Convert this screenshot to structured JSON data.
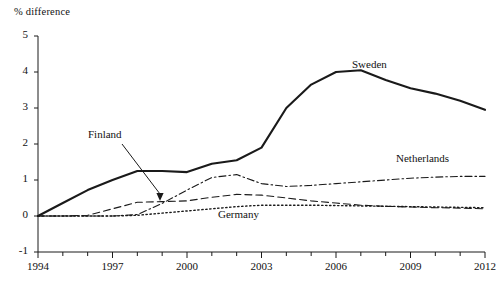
{
  "chart_data": {
    "type": "line",
    "title": "",
    "ylabel": "% difference",
    "xlabel": "",
    "xlim": [
      1994,
      2012
    ],
    "ylim": [
      -1,
      5
    ],
    "grid": false,
    "legend_position": "inline-annotations",
    "x": [
      1994,
      1995,
      1996,
      1997,
      1998,
      1999,
      2000,
      2001,
      2002,
      2003,
      2004,
      2005,
      2006,
      2007,
      2008,
      2009,
      2010,
      2011,
      2012
    ],
    "yticks": [
      "5",
      "4",
      "3",
      "2",
      "1",
      "0",
      "-1"
    ],
    "xticks": [
      "1994",
      "1997",
      "2000",
      "2003",
      "2006",
      "2009",
      "2012"
    ],
    "xticks_minor": [
      "1995",
      "1996",
      "1998",
      "1999",
      "2001",
      "2002",
      "2004",
      "2005",
      "2007",
      "2008",
      "2010",
      "2011"
    ],
    "series": [
      {
        "name": "Sweden",
        "style": "solid",
        "color": "#1a1a1a",
        "width": 2.1,
        "label_x": 352,
        "label_y": 58,
        "values": [
          0.0,
          0.36,
          0.72,
          1.0,
          1.25,
          1.25,
          1.22,
          1.45,
          1.55,
          1.9,
          3.0,
          3.65,
          4.0,
          4.05,
          3.78,
          3.55,
          3.4,
          3.2,
          2.95
        ]
      },
      {
        "name": "Netherlands",
        "style": "dashdot",
        "color": "#1a1a1a",
        "width": 1.1,
        "label_x": 396,
        "label_y": 152,
        "values": [
          0.0,
          0.0,
          0.0,
          0.0,
          0.04,
          0.35,
          0.72,
          1.07,
          1.15,
          0.9,
          0.82,
          0.85,
          0.9,
          0.95,
          1.0,
          1.05,
          1.08,
          1.1,
          1.1
        ]
      },
      {
        "name": "Finland",
        "style": "dashed",
        "color": "#1a1a1a",
        "width": 1.1,
        "label_x": 88,
        "label_y": 128,
        "arrow_from_x": 122,
        "arrow_from_y": 144,
        "arrow_to_x": 160,
        "arrow_to_y": 201,
        "values": [
          0.0,
          0.0,
          0.02,
          0.2,
          0.38,
          0.4,
          0.42,
          0.52,
          0.6,
          0.58,
          0.5,
          0.42,
          0.36,
          0.3,
          0.27,
          0.25,
          0.23,
          0.22,
          0.2
        ]
      },
      {
        "name": "Germany",
        "style": "dotted",
        "color": "#1a1a1a",
        "width": 1.4,
        "label_x": 218,
        "label_y": 208,
        "values": [
          0.0,
          0.0,
          0.0,
          0.0,
          0.02,
          0.08,
          0.14,
          0.2,
          0.26,
          0.3,
          0.3,
          0.3,
          0.29,
          0.28,
          0.27,
          0.26,
          0.25,
          0.24,
          0.23
        ]
      }
    ]
  },
  "axes": {
    "ylabel_text": "% difference"
  }
}
